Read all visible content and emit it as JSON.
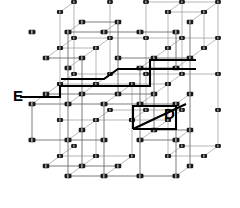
{
  "figure": {
    "type": "lattice-diagram",
    "title": "",
    "background_color": "#ffffff",
    "width": 240,
    "height": 208
  },
  "lattice": {
    "nx": 5,
    "ny": 5,
    "nz": 4,
    "origin_x": 32,
    "origin_y": 176,
    "step_x": 36,
    "step_y": -36,
    "depth_dx": 14,
    "depth_dy": -10,
    "edge_color": "#9a9a9a",
    "edge_color_strong": "#6e6e6e",
    "edge_width": 0.9,
    "node_color": "#1a1a1a",
    "node_highlight_color": "#ffffff",
    "node_width": 7,
    "node_height": 4.6,
    "highlight_color": "#000000",
    "highlight_width": 2.1
  },
  "labels": [
    {
      "id": "label-E",
      "text": "E",
      "x": 13,
      "y": 88
    },
    {
      "id": "label-D",
      "text": "D",
      "x": 164,
      "y": 106
    }
  ],
  "highlight_paths": [
    {
      "name": "path-E",
      "points": [
        [
          20,
          97
        ],
        [
          60,
          97
        ],
        [
          60,
          86
        ],
        [
          150,
          86
        ],
        [
          150,
          60
        ],
        [
          196,
          60
        ]
      ]
    },
    {
      "name": "path-D",
      "points": [
        [
          133,
          129
        ],
        [
          133,
          106
        ],
        [
          176,
          106
        ],
        [
          176,
          129
        ],
        [
          133,
          129
        ]
      ]
    },
    {
      "name": "path-upper",
      "points": [
        [
          61,
          79
        ],
        [
          104,
          79
        ],
        [
          118,
          69
        ],
        [
          196,
          69
        ]
      ]
    },
    {
      "name": "path-lower",
      "points": [
        [
          133,
          129
        ],
        [
          186,
          104
        ]
      ]
    }
  ]
}
